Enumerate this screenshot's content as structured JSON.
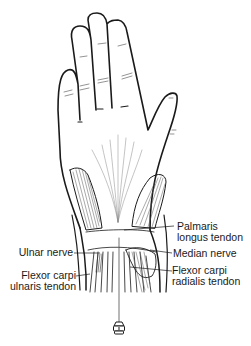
{
  "figure": {
    "labels": {
      "palmaris_longus_line1": "Palmaris",
      "palmaris_longus_line2": "longus tendon",
      "median_nerve": "Median nerve",
      "flexor_carpi_radialis_line1": "Flexor carpi",
      "flexor_carpi_radialis_line2": "radialis tendon",
      "ulnar_nerve": "Ulnar nerve",
      "flexor_carpi_ulnaris_line1": "Flexor carpi",
      "flexor_carpi_ulnaris_line2": "ulnaris tendon"
    },
    "colors": {
      "ink": "#1a1a1a",
      "hatch": "#555555",
      "background": "#ffffff"
    }
  }
}
